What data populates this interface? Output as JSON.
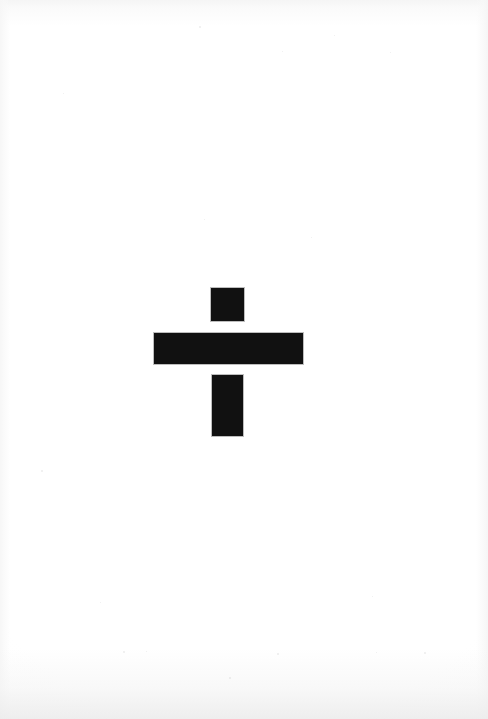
{
  "image": {
    "kind": "scanned-page",
    "title": "Scanned geometric figure",
    "description": "A black cruciform / dagger-like figure composed of three solid rectangles centered on a blank white scanned page.",
    "width": 488,
    "height": 719,
    "background_color": "#ffffff",
    "ink_color": "#111111",
    "paper_edge_color": "#f6f6f6",
    "text_content": "",
    "caption": ""
  },
  "figure": {
    "name": "cruciform-figure",
    "label": "Black cross / dagger glyph",
    "shape_count": 3,
    "shapes": [
      {
        "name": "stem-top",
        "label": "Upper square (top of stem)",
        "type": "rectangle",
        "fill": "#111111",
        "x": 211,
        "y": 288,
        "width": 33,
        "height": 33
      },
      {
        "name": "crossbar",
        "label": "Horizontal crossbar",
        "type": "rectangle",
        "fill": "#111111",
        "x": 154,
        "y": 333,
        "width": 149,
        "height": 31
      },
      {
        "name": "stem-bottom",
        "label": "Lower vertical bar (bottom of stem)",
        "type": "rectangle",
        "fill": "#111111",
        "x": 212,
        "y": 375,
        "width": 31,
        "height": 61
      }
    ],
    "gaps": [
      {
        "name": "gap-square-to-bar",
        "label": "Gap between upper square and crossbar",
        "height": 12
      },
      {
        "name": "gap-bar-to-stem",
        "label": "Gap between crossbar and lower bar",
        "height": 11
      }
    ],
    "bounds": {
      "left": 154,
      "top": 288,
      "right": 303,
      "bottom": 436
    },
    "center_x": 228
  },
  "speckles": [
    {
      "x": 41,
      "y": 470,
      "size": 2
    },
    {
      "x": 123,
      "y": 651,
      "size": 2
    },
    {
      "x": 146,
      "y": 651,
      "size": 1
    },
    {
      "x": 277,
      "y": 653,
      "size": 2
    },
    {
      "x": 376,
      "y": 652,
      "size": 1
    },
    {
      "x": 424,
      "y": 652,
      "size": 2
    },
    {
      "x": 372,
      "y": 596,
      "size": 1
    },
    {
      "x": 545,
      "y": 661,
      "size": 1
    },
    {
      "x": 229,
      "y": 677,
      "size": 2
    },
    {
      "x": 63,
      "y": 93,
      "size": 1
    },
    {
      "x": 600,
      "y": 60,
      "size": 1
    },
    {
      "x": 199,
      "y": 26,
      "size": 2
    },
    {
      "x": 334,
      "y": 35,
      "size": 1
    },
    {
      "x": 282,
      "y": 51,
      "size": 1
    },
    {
      "x": 390,
      "y": 52,
      "size": 1
    },
    {
      "x": 204,
      "y": 219,
      "size": 1
    },
    {
      "x": 100,
      "y": 602,
      "size": 1
    },
    {
      "x": 311,
      "y": 237,
      "size": 1
    }
  ]
}
